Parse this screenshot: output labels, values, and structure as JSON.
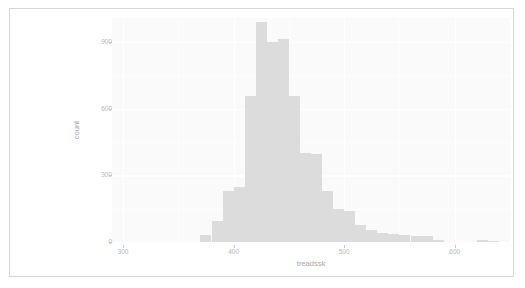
{
  "figure": {
    "background_color": "#ffffff",
    "frame_color": "#d6d6d6",
    "panel_color": "#fafafa",
    "bar_color": "#dcdcdc",
    "gridline_color": "#ffffff",
    "axis_text_color": "#b9b9b9"
  },
  "chart_data": {
    "type": "bar",
    "title": "",
    "subtitle": "",
    "xlabel": "treadssk",
    "ylabel": "count",
    "grid": true,
    "legend": "none",
    "xlim": [
      290,
      650
    ],
    "ylim": [
      0,
      1010
    ],
    "xticks": [
      300,
      400,
      500,
      600
    ],
    "xtick_labels": [
      "300",
      "400",
      "500",
      "600"
    ],
    "yticks": [
      0,
      300,
      600,
      900
    ],
    "ytick_labels": [
      "0",
      "300",
      "600",
      "900"
    ],
    "bin_width": 10,
    "bin_starts": [
      370,
      380,
      390,
      400,
      410,
      420,
      430,
      440,
      450,
      460,
      470,
      480,
      490,
      500,
      510,
      520,
      530,
      540,
      550,
      560,
      570,
      580,
      590,
      620,
      630
    ],
    "categories": [
      "370",
      "380",
      "390",
      "400",
      "410",
      "420",
      "430",
      "440",
      "450",
      "460",
      "470",
      "480",
      "490",
      "500",
      "510",
      "520",
      "530",
      "540",
      "550",
      "560",
      "570",
      "580",
      "590",
      "620",
      "630"
    ],
    "values": [
      30,
      95,
      230,
      250,
      660,
      990,
      900,
      915,
      660,
      400,
      395,
      230,
      150,
      140,
      75,
      55,
      40,
      35,
      30,
      25,
      25,
      10,
      0,
      8,
      6
    ]
  }
}
